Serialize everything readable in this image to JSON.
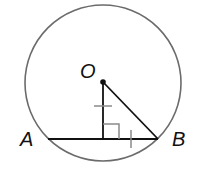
{
  "diagram": {
    "type": "circle-chord-geometry",
    "labels": {
      "center": "O",
      "chord_left": "A",
      "chord_right": "B"
    },
    "colors": {
      "circle": "#6b6b6b",
      "lines": "#111111",
      "marks": "#8a8a8a",
      "background": "#ffffff"
    },
    "elements": {
      "circle": "circle with center O",
      "chord": "segment AB",
      "perpendicular": "segment from O perpendicular to AB",
      "radius": "segment OB",
      "right_angle_mark": "right angle at foot of perpendicular",
      "congruence_ticks": "single tick on perpendicular and on half-chord"
    }
  }
}
